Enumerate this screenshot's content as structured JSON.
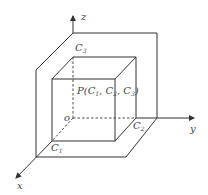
{
  "diagram": {
    "axes": {
      "x": "x",
      "y": "y",
      "z": "z",
      "origin": "o"
    },
    "labels": {
      "c1_main": "C",
      "c1_sub": "1",
      "c2_main": "C",
      "c2_sub": "2",
      "c3_main": "C",
      "c3_sub": "3",
      "point": "P(C",
      "point_s1": "1",
      "point_sep1": ", C",
      "point_s2": "2",
      "point_sep2": ", C",
      "point_s3": "3",
      "point_end": ")"
    },
    "colors": {
      "line": "#333333",
      "text": "#444444"
    }
  }
}
